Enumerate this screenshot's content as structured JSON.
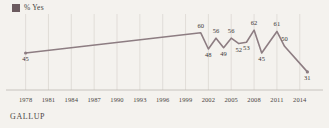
{
  "legend": {
    "swatch_name": "legend-color-swatch",
    "swatch_color": "#6b5b5f",
    "label": "% Yes"
  },
  "footer": {
    "source": "GALLUP"
  },
  "style": {
    "line_color": "#8d7d82",
    "gridline_color": "#d8d4ce",
    "axis_color": "#bdb8b1",
    "background": "#f4f2ee"
  },
  "chart_data": {
    "type": "line",
    "title": "",
    "subtitle": "",
    "xlabel": "",
    "ylabel": "",
    "grid": "vertical",
    "legend_position": "top-left",
    "xlim": [
      1977,
      2016
    ],
    "ylim": [
      25,
      68
    ],
    "tick_labels": [
      "1978",
      "1981",
      "1984",
      "1987",
      "1990",
      "1993",
      "1996",
      "1999",
      "2002",
      "2005",
      "2008",
      "2011",
      "2014"
    ],
    "series": [
      {
        "name": "% Yes",
        "color": "#8d7d82",
        "points": [
          {
            "x": 1978,
            "y": 45,
            "label": "45",
            "label_pos": "below"
          },
          {
            "x": 2001,
            "y": 60,
            "label": "60",
            "label_pos": "above"
          },
          {
            "x": 2002,
            "y": 48,
            "label": "48",
            "label_pos": "below"
          },
          {
            "x": 2003,
            "y": 56,
            "label": "56",
            "label_pos": "above"
          },
          {
            "x": 2004,
            "y": 49,
            "label": "49",
            "label_pos": "below"
          },
          {
            "x": 2005,
            "y": 56,
            "label": "56",
            "label_pos": "above"
          },
          {
            "x": 2006,
            "y": 52,
            "label": "52",
            "label_pos": "below"
          },
          {
            "x": 2007,
            "y": 53,
            "label": "53",
            "label_pos": "below"
          },
          {
            "x": 2008,
            "y": 62,
            "label": "62",
            "label_pos": "above"
          },
          {
            "x": 2009,
            "y": 45,
            "label": "45",
            "label_pos": "below"
          },
          {
            "x": 2011,
            "y": 61,
            "label": "61",
            "label_pos": "above"
          },
          {
            "x": 2012,
            "y": 50,
            "label": "50",
            "label_pos": "above"
          },
          {
            "x": 2015,
            "y": 31,
            "label": "31",
            "label_pos": "below"
          }
        ]
      }
    ]
  }
}
